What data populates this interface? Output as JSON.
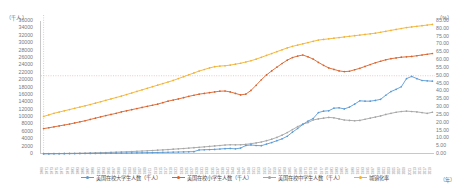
{
  "axes": {
    "left_unit": "（千人）",
    "right_unit": "（%）",
    "x_unit": "（年）",
    "left_ticks": [
      "36000",
      "34000",
      "32000",
      "30000",
      "28000",
      "26000",
      "24000",
      "22000",
      "20000",
      "18000",
      "16000",
      "14000",
      "12000",
      "10000",
      "8000",
      "6000",
      "4000",
      "2000",
      "0"
    ],
    "right_ticks": [
      "85.00",
      "80.00",
      "75.00",
      "70.00",
      "65.00",
      "60.00",
      "55.00",
      "50.00",
      "45.00",
      "40.00",
      "35.00",
      "30.00",
      "25.00",
      "20.00",
      "15.00",
      "10.00",
      "5.00",
      "0.00"
    ]
  },
  "legend": [
    {
      "label": "美国在校大学生人数（千人）",
      "color": "#5b9bd5"
    },
    {
      "label": "美国在校小学生人数（千人）",
      "color": "#d9622b"
    },
    {
      "label": "美国在校中学生人数（千人）",
      "color": "#a5a5a5"
    },
    {
      "label": "城镇化率",
      "color": "#f2b233"
    }
  ],
  "chart_data": {
    "type": "line",
    "title": "",
    "xlabel": "（年）",
    "ylabel": "（千人）",
    "y2label": "（%）",
    "ylim": [
      0,
      36000
    ],
    "y2lim": [
      0,
      85
    ],
    "grid": false,
    "legend_position": "bottom",
    "annotations": [
      {
        "type": "vline",
        "x": "1940",
        "style": "dotted",
        "color": "#c4a8c8"
      },
      {
        "type": "hline",
        "y2": 50.0,
        "style": "dotted",
        "color": "#e8a0a0"
      }
    ],
    "x": [
      "1869",
      "1871",
      "1873",
      "1875",
      "1877",
      "1879",
      "1881",
      "1883",
      "1885",
      "1887",
      "1889",
      "1891",
      "1893",
      "1895",
      "1897",
      "1899",
      "1901",
      "1903",
      "1905",
      "1907",
      "1909",
      "1911",
      "1913",
      "1915",
      "1917",
      "1919",
      "1921",
      "1923",
      "1925",
      "1927",
      "1929",
      "1931",
      "1933",
      "1935",
      "1937",
      "1939",
      "1941",
      "1943",
      "1945",
      "1947",
      "1949",
      "1951",
      "1953",
      "1955",
      "1957",
      "1959",
      "1961",
      "1963",
      "1965",
      "1967",
      "1969",
      "1971",
      "1973",
      "1975",
      "1977",
      "1979",
      "1981",
      "1983",
      "1985",
      "1987",
      "1989",
      "1991",
      "1993",
      "1995",
      "1997",
      "1999",
      "2001",
      "2003",
      "2005",
      "2007",
      "2009",
      "2011",
      "2013",
      "2015",
      "2017",
      "2019"
    ],
    "series": [
      {
        "name": "美国在校大学生人数（千人）",
        "color": "#5b9bd5",
        "axis": "left",
        "values": [
          60,
          68,
          76,
          85,
          95,
          105,
          115,
          126,
          137,
          150,
          163,
          178,
          193,
          210,
          228,
          247,
          268,
          290,
          312,
          336,
          360,
          386,
          412,
          440,
          468,
          500,
          532,
          566,
          600,
          640,
          1100,
          1150,
          1200,
          1250,
          1350,
          1450,
          1500,
          1400,
          1600,
          2300,
          2450,
          2300,
          2250,
          2680,
          3100,
          3600,
          4100,
          4800,
          5900,
          6900,
          8000,
          8900,
          9600,
          11200,
          11600,
          11700,
          12400,
          12500,
          12200,
          12700,
          13500,
          14400,
          14300,
          14300,
          14500,
          14800,
          15900,
          16900,
          17500,
          18200,
          20400,
          21000,
          20400,
          19900,
          19800,
          19700
        ]
      },
      {
        "name": "美国在校小学生人数（千人）",
        "color": "#d9622b",
        "axis": "left",
        "values": [
          6870,
          7100,
          7350,
          7600,
          7850,
          8100,
          8400,
          8700,
          9000,
          9350,
          9700,
          10050,
          10400,
          10700,
          11000,
          11400,
          11700,
          12000,
          12300,
          12600,
          12900,
          13200,
          13500,
          13900,
          14300,
          14600,
          14900,
          15250,
          15600,
          15900,
          16200,
          16400,
          16600,
          16800,
          17000,
          17050,
          16800,
          16400,
          16000,
          16200,
          17200,
          18600,
          20100,
          21400,
          22500,
          23500,
          24500,
          25400,
          26100,
          26500,
          26800,
          26300,
          25700,
          24800,
          24000,
          23300,
          22900,
          22500,
          22300,
          22400,
          22800,
          23200,
          23700,
          24200,
          24700,
          25100,
          25500,
          25800,
          26000,
          26200,
          26300,
          26400,
          26600,
          26800,
          27000,
          27200
        ]
      },
      {
        "name": "美国在校中学生人数（千人）",
        "color": "#a5a5a5",
        "axis": "left",
        "values": [
          80,
          95,
          110,
          128,
          148,
          170,
          195,
          222,
          252,
          285,
          322,
          362,
          405,
          452,
          502,
          555,
          612,
          672,
          736,
          804,
          876,
          952,
          1032,
          1116,
          1204,
          1296,
          1392,
          1492,
          1596,
          1704,
          1816,
          1932,
          2052,
          2176,
          2304,
          2436,
          2500,
          2480,
          2500,
          2600,
          2800,
          3000,
          3250,
          3600,
          4000,
          4500,
          5100,
          5800,
          6600,
          7400,
          8100,
          8500,
          9200,
          9500,
          9700,
          9900,
          9800,
          9500,
          9200,
          9100,
          9000,
          9100,
          9400,
          9700,
          10000,
          10300,
          10700,
          11000,
          11300,
          11500,
          11600,
          11500,
          11400,
          11200,
          11000,
          11300
        ]
      },
      {
        "name": "城镇化率",
        "color": "#f2b233",
        "axis": "right",
        "values": [
          24.0,
          25.0,
          26.0,
          26.8,
          27.6,
          28.4,
          29.2,
          30.0,
          30.8,
          31.6,
          32.5,
          33.4,
          34.3,
          35.2,
          36.1,
          37.0,
          38.0,
          39.0,
          40.0,
          41.0,
          42.0,
          43.0,
          44.0,
          45.0,
          46.0,
          47.0,
          48.2,
          49.4,
          50.6,
          51.8,
          53.0,
          54.0,
          55.0,
          55.8,
          56.2,
          56.4,
          56.8,
          57.4,
          58.0,
          58.8,
          59.6,
          60.6,
          61.8,
          63.0,
          64.2,
          65.4,
          66.6,
          67.8,
          68.8,
          69.6,
          70.4,
          71.2,
          72.0,
          72.8,
          73.2,
          73.6,
          74.0,
          74.4,
          74.8,
          75.2,
          75.6,
          76.0,
          76.4,
          76.8,
          77.2,
          77.8,
          78.4,
          79.0,
          79.6,
          80.2,
          80.8,
          81.2,
          81.6,
          82.0,
          82.4,
          82.8
        ]
      }
    ]
  }
}
